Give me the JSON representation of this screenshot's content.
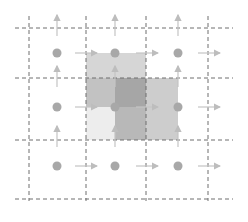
{
  "diagram": {
    "colors": {
      "background": "#ffffff",
      "grid_line": "#6e6e6e",
      "dot": "#a8a8a8",
      "arrow": "#c4c4c4",
      "shade_light": "#d9d9d9",
      "shade_mid": "#b9b9b9",
      "shade_dark": "#9c9c9c",
      "shade_faint": "#efefef"
    },
    "grid": {
      "vertical_x": [
        29,
        86,
        146,
        208
      ],
      "horizontal_y": [
        28,
        78,
        140,
        199
      ],
      "x_extent": [
        15,
        233
      ],
      "y_extent": [
        16,
        201
      ]
    },
    "dots": {
      "x": [
        57,
        115,
        178
      ],
      "y": [
        53,
        107,
        166
      ],
      "radius": 4.5
    },
    "right_arrows": {
      "x_start": [
        75,
        136,
        198
      ],
      "length": 22
    },
    "up_arrows": {
      "y_tip_above_row": [
        15,
        66,
        126
      ],
      "length": 21
    },
    "shaded_regions": [
      {
        "name": "upper-square",
        "x": 86,
        "y": 53,
        "w": 60,
        "h": 54,
        "color": "#d6d6d6"
      },
      {
        "name": "middle-square",
        "x": 86,
        "y": 78,
        "w": 60,
        "h": 62,
        "color": "#c2c2c2"
      },
      {
        "name": "right-square",
        "x": 115,
        "y": 78,
        "w": 63,
        "h": 62,
        "color": "#cdcdcd"
      },
      {
        "name": "center-overlap",
        "x": 115,
        "y": 78,
        "w": 31,
        "h": 29,
        "color": "#a6a6a6"
      },
      {
        "name": "lower-left-faint",
        "x": 86,
        "y": 107,
        "w": 29,
        "h": 33,
        "color": "#ededed"
      },
      {
        "name": "lower-middle",
        "x": 115,
        "y": 107,
        "w": 31,
        "h": 33,
        "color": "#b8b8b8"
      }
    ]
  }
}
